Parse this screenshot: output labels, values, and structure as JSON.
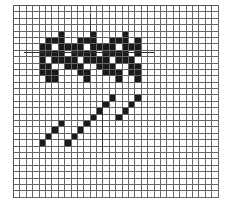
{
  "grid": {
    "columns": 32,
    "rows": 30,
    "colors": {
      "filled": "#1a1a1a",
      "empty": "#ffffff",
      "lines": "#666666"
    },
    "filled_cells": {
      "pattern": [
        [
          4,
          7
        ],
        [
          4,
          12
        ],
        [
          4,
          17
        ],
        [
          5,
          5
        ],
        [
          5,
          6
        ],
        [
          5,
          7
        ],
        [
          5,
          10
        ],
        [
          5,
          11
        ],
        [
          5,
          12
        ],
        [
          5,
          15
        ],
        [
          5,
          16
        ],
        [
          5,
          17
        ],
        [
          5,
          19
        ],
        [
          6,
          4
        ],
        [
          6,
          5
        ],
        [
          6,
          7
        ],
        [
          6,
          8
        ],
        [
          6,
          9
        ],
        [
          6,
          10
        ],
        [
          6,
          12
        ],
        [
          6,
          13
        ],
        [
          6,
          14
        ],
        [
          6,
          15
        ],
        [
          6,
          17
        ],
        [
          6,
          18
        ],
        [
          6,
          19
        ],
        [
          7,
          4
        ],
        [
          7,
          5
        ],
        [
          7,
          6
        ],
        [
          7,
          7
        ],
        [
          7,
          9
        ],
        [
          7,
          10
        ],
        [
          7,
          11
        ],
        [
          7,
          12
        ],
        [
          7,
          14
        ],
        [
          7,
          15
        ],
        [
          7,
          16
        ],
        [
          7,
          17
        ],
        [
          7,
          19
        ],
        [
          8,
          4
        ],
        [
          8,
          6
        ],
        [
          8,
          7
        ],
        [
          8,
          8
        ],
        [
          8,
          9
        ],
        [
          8,
          11
        ],
        [
          8,
          12
        ],
        [
          8,
          13
        ],
        [
          8,
          14
        ],
        [
          8,
          16
        ],
        [
          8,
          17
        ],
        [
          8,
          18
        ],
        [
          9,
          4
        ],
        [
          9,
          5
        ],
        [
          9,
          8
        ],
        [
          9,
          9
        ],
        [
          9,
          10
        ],
        [
          9,
          13
        ],
        [
          9,
          14
        ],
        [
          9,
          15
        ],
        [
          9,
          18
        ],
        [
          9,
          19
        ],
        [
          10,
          4
        ],
        [
          10,
          5
        ],
        [
          10,
          6
        ],
        [
          10,
          10
        ],
        [
          10,
          11
        ],
        [
          10,
          14
        ],
        [
          10,
          15
        ],
        [
          10,
          16
        ],
        [
          10,
          18
        ],
        [
          10,
          19
        ],
        [
          11,
          5
        ],
        [
          11,
          6
        ],
        [
          11,
          11
        ],
        [
          11,
          16
        ],
        [
          11,
          19
        ]
      ],
      "diagonal_a": [
        [
          21,
          4
        ],
        [
          20,
          5
        ],
        [
          19,
          6
        ],
        [
          18,
          7
        ]
      ],
      "diagonal_b": [
        [
          21,
          8
        ],
        [
          20,
          9
        ],
        [
          19,
          10
        ],
        [
          18,
          11
        ],
        [
          17,
          12
        ],
        [
          16,
          13
        ],
        [
          15,
          14
        ],
        [
          14,
          15
        ]
      ],
      "diagonal_c": [
        [
          17,
          16
        ],
        [
          16,
          17
        ],
        [
          15,
          18
        ],
        [
          14,
          19
        ]
      ]
    }
  },
  "marks": [
    {
      "name": "horizontal-guide-line",
      "x": 24,
      "y": 52,
      "w": 130,
      "h": 1
    },
    {
      "name": "vertical-guide-line-top",
      "x": 90,
      "y": 14,
      "w": 1,
      "h": 36
    },
    {
      "name": "vertical-guide-line-bottom",
      "x": 102,
      "y": 100,
      "w": 1,
      "h": 52
    }
  ]
}
